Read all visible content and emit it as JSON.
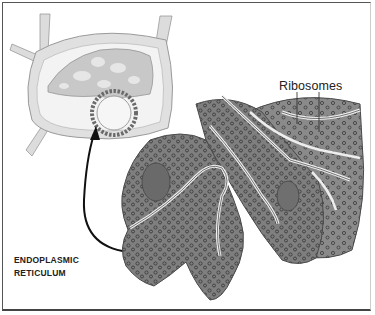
{
  "diagram": {
    "labels": {
      "ribosomes": "Ribosomes",
      "er_line1": "ENDOPLASMIC",
      "er_line2": "RETICULUM"
    },
    "colors": {
      "er_fill": "#7d7d7d",
      "er_dark": "#5a5a5a",
      "cell_wall": "#d9d9d9",
      "cell_interior": "#f2f2f2",
      "chloroplast": "#c4c4c4",
      "ribosome": "#3f3f3f",
      "membrane_highlight": "#e8e8e8",
      "arrow": "#111111",
      "border": "#555555"
    }
  }
}
